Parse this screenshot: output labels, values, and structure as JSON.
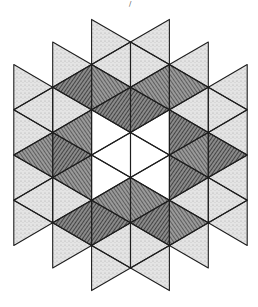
{
  "figure": {
    "title": "",
    "stray_mark": "/"
  },
  "geometry": {
    "center": [
      130.5,
      155
    ],
    "column_width": 38.9,
    "half_row": 22.6,
    "rings": 3
  },
  "colors": {
    "background": "#ffffff",
    "line": "#1e1e1e",
    "star_fill": "#5a5a5a",
    "star_hatch": "#222222",
    "outer_fill": "#d6d6d6",
    "center_fill": "#ffffff"
  },
  "regions": {
    "center": "white hexagon of 6 triangles",
    "star": "dark cross-hatched hexagram points",
    "outer": "light stippled triangles"
  }
}
